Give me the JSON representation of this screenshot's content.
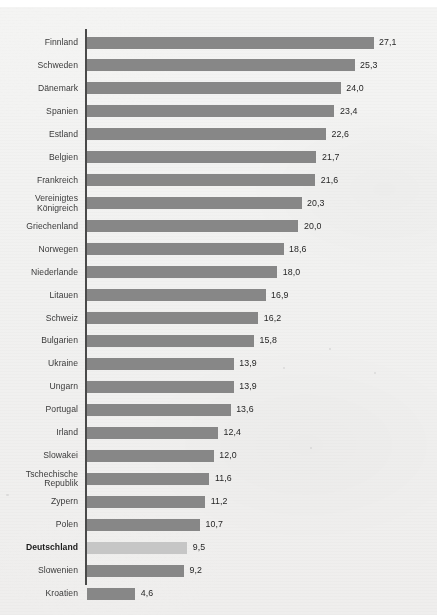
{
  "header": {
    "clipped_note": ""
  },
  "chart_data": {
    "type": "bar",
    "orientation": "horizontal",
    "title": "",
    "subtitle": "",
    "xlabel": "",
    "ylabel": "",
    "xlim": [
      0,
      27.1
    ],
    "grid": false,
    "legend": null,
    "decimal_separator": ",",
    "highlight_category": "Deutschland",
    "colors": {
      "bar": "#878787",
      "bar_highlight": "#c6c6c6",
      "axis": "#4a4a4a",
      "background": "#f1f1f0",
      "label_text": "#3a3a3a",
      "value_text": "#262626"
    },
    "categories": [
      "Finnland",
      "Schweden",
      "Dänemark",
      "Spanien",
      "Estland",
      "Belgien",
      "Frankreich",
      "Vereinigtes Königreich",
      "Griechenland",
      "Norwegen",
      "Niederlande",
      "Litauen",
      "Schweiz",
      "Bulgarien",
      "Ukraine",
      "Ungarn",
      "Portugal",
      "Irland",
      "Slowakei",
      "Tschechische Republik",
      "Zypern",
      "Polen",
      "Deutschland",
      "Slowenien",
      "Kroatien"
    ],
    "values": [
      27.1,
      25.3,
      24.0,
      23.4,
      22.6,
      21.7,
      21.6,
      20.3,
      20.0,
      18.6,
      18.0,
      16.9,
      16.2,
      15.8,
      13.9,
      13.9,
      13.6,
      12.4,
      12.0,
      11.6,
      11.2,
      10.7,
      9.5,
      9.2,
      4.6
    ],
    "value_labels": [
      "27,1",
      "25,3",
      "24,0",
      "23,4",
      "22,6",
      "21,7",
      "21,6",
      "20,3",
      "20,0",
      "18,6",
      "18,0",
      "16,9",
      "16,2",
      "15,8",
      "13,9",
      "13,9",
      "13,6",
      "12,4",
      "12,0",
      "11,6",
      "11,2",
      "10,7",
      "9,5",
      "9,2",
      "4,6"
    ],
    "category_label_lines": [
      [
        "Finnland"
      ],
      [
        "Schweden"
      ],
      [
        "Dänemark"
      ],
      [
        "Spanien"
      ],
      [
        "Estland"
      ],
      [
        "Belgien"
      ],
      [
        "Frankreich"
      ],
      [
        "Vereinigtes",
        "Königreich"
      ],
      [
        "Griechenland"
      ],
      [
        "Norwegen"
      ],
      [
        "Niederlande"
      ],
      [
        "Litauen"
      ],
      [
        "Schweiz"
      ],
      [
        "Bulgarien"
      ],
      [
        "Ukraine"
      ],
      [
        "Ungarn"
      ],
      [
        "Portugal"
      ],
      [
        "Irland"
      ],
      [
        "Slowakei"
      ],
      [
        "Tschechische",
        "Republik"
      ],
      [
        "Zypern"
      ],
      [
        "Polen"
      ],
      [
        "Deutschland"
      ],
      [
        "Slowenien"
      ],
      [
        "Kroatien"
      ]
    ]
  }
}
